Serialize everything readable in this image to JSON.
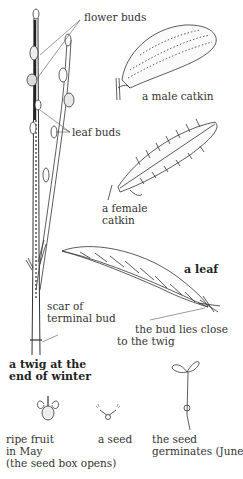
{
  "diagram": {
    "labels": {
      "flower_buds": "flower buds",
      "leaf_buds": "leaf buds",
      "male_catkin": "a male catkin",
      "female_catkin_1": "a female",
      "female_catkin_2": "catkin",
      "leaf": "a leaf",
      "scar_1": "scar of",
      "scar_2": "terminal bud",
      "bud_close_1": "the bud lies close",
      "bud_close_2": "to the twig",
      "twig_title_1": "a twig at the",
      "twig_title_2": "end of winter",
      "fruit_1": "ripe fruit",
      "fruit_2": "in May",
      "fruit_3": "(the seed box opens)",
      "seed": "a seed",
      "germ_1": "the seed",
      "germ_2": "germinates (June)"
    }
  }
}
